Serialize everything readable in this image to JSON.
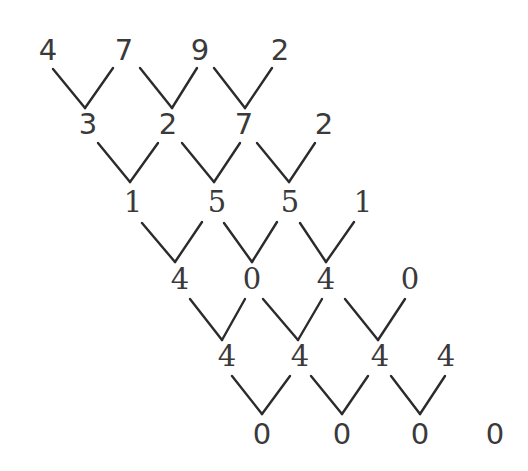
{
  "diagram": {
    "rows": [
      {
        "values": [
          "4",
          "7",
          "9",
          "2"
        ],
        "x": [
          48,
          124,
          200,
          280
        ],
        "y": 36,
        "font": "sans"
      },
      {
        "values": [
          "3",
          "2",
          "7",
          "2"
        ],
        "x": [
          88,
          168,
          244,
          324
        ],
        "y": 110,
        "font": "sans"
      },
      {
        "values": [
          "1",
          "5",
          "5",
          "1"
        ],
        "x": [
          133,
          217,
          290,
          363
        ],
        "y": 188,
        "font": "serif"
      },
      {
        "values": [
          "4",
          "0",
          "4",
          "0"
        ],
        "x": [
          180,
          252,
          326,
          410
        ],
        "y": 265,
        "font": "serif"
      },
      {
        "values": [
          "4",
          "4",
          "4",
          "4"
        ],
        "x": [
          227,
          300,
          380,
          446
        ],
        "y": 342,
        "font": "serif"
      },
      {
        "values": [
          "0",
          "0",
          "0",
          "0"
        ],
        "x": [
          262,
          342,
          420,
          495
        ],
        "y": 420,
        "font": "sans"
      }
    ],
    "connectors": [
      [
        [
          53,
          69
        ],
        [
          85,
          108
        ],
        [
          113,
          68
        ]
      ],
      [
        [
          140,
          68
        ],
        [
          172,
          108
        ],
        [
          197,
          68
        ]
      ],
      [
        [
          214,
          68
        ],
        [
          245,
          108
        ],
        [
          272,
          68
        ]
      ],
      [
        [
          98,
          143
        ],
        [
          130,
          182
        ],
        [
          158,
          143
        ]
      ],
      [
        [
          182,
          143
        ],
        [
          214,
          182
        ],
        [
          240,
          143
        ]
      ],
      [
        [
          257,
          143
        ],
        [
          289,
          182
        ],
        [
          315,
          143
        ]
      ],
      [
        [
          142,
          223
        ],
        [
          175,
          262
        ],
        [
          202,
          222
        ]
      ],
      [
        [
          224,
          223
        ],
        [
          252,
          262
        ],
        [
          277,
          222
        ]
      ],
      [
        [
          300,
          223
        ],
        [
          326,
          262
        ],
        [
          354,
          222
        ]
      ],
      [
        [
          190,
          299
        ],
        [
          222,
          340
        ],
        [
          245,
          299
        ]
      ],
      [
        [
          263,
          299
        ],
        [
          298,
          340
        ],
        [
          322,
          299
        ]
      ],
      [
        [
          345,
          299
        ],
        [
          378,
          340
        ],
        [
          405,
          299
        ]
      ],
      [
        [
          232,
          376
        ],
        [
          262,
          414
        ],
        [
          290,
          376
        ]
      ],
      [
        [
          311,
          376
        ],
        [
          342,
          414
        ],
        [
          368,
          376
        ]
      ],
      [
        [
          391,
          376
        ],
        [
          420,
          414
        ],
        [
          445,
          376
        ]
      ]
    ]
  }
}
